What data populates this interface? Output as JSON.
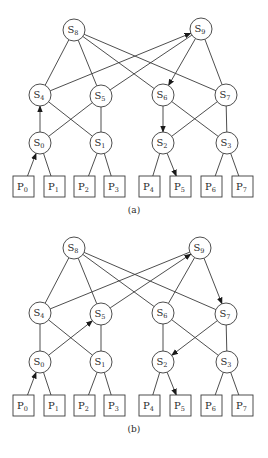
{
  "diagrams": [
    {
      "id": "a",
      "caption": "(a)",
      "caption_pos": [
        134,
        213
      ],
      "switches": [
        {
          "label": "S",
          "sub": "0",
          "x": 40,
          "y": 143
        },
        {
          "label": "S",
          "sub": "1",
          "x": 101,
          "y": 143
        },
        {
          "label": "S",
          "sub": "2",
          "x": 163,
          "y": 143
        },
        {
          "label": "S",
          "sub": "3",
          "x": 227,
          "y": 143
        },
        {
          "label": "S",
          "sub": "4",
          "x": 40,
          "y": 95
        },
        {
          "label": "S",
          "sub": "5",
          "x": 101,
          "y": 96
        },
        {
          "label": "S",
          "sub": "6",
          "x": 163,
          "y": 95
        },
        {
          "label": "S",
          "sub": "7",
          "x": 226,
          "y": 95
        },
        {
          "label": "S",
          "sub": "8",
          "x": 74,
          "y": 30
        },
        {
          "label": "S",
          "sub": "9",
          "x": 201,
          "y": 29
        }
      ],
      "processors": [
        {
          "label": "P",
          "sub": "0",
          "x": 13,
          "y": 176
        },
        {
          "label": "P",
          "sub": "1",
          "x": 44,
          "y": 176
        },
        {
          "label": "P",
          "sub": "2",
          "x": 74,
          "y": 176
        },
        {
          "label": "P",
          "sub": "3",
          "x": 104,
          "y": 176
        },
        {
          "label": "P",
          "sub": "4",
          "x": 139,
          "y": 176
        },
        {
          "label": "P",
          "sub": "5",
          "x": 170,
          "y": 176
        },
        {
          "label": "P",
          "sub": "6",
          "x": 201,
          "y": 176
        },
        {
          "label": "P",
          "sub": "7",
          "x": 232,
          "y": 176
        }
      ],
      "edges": [
        {
          "from": "P0",
          "to": "S0",
          "arrow": true
        },
        {
          "from": "P1",
          "to": "S0",
          "arrow": false
        },
        {
          "from": "P2",
          "to": "S1",
          "arrow": false
        },
        {
          "from": "P3",
          "to": "S1",
          "arrow": false
        },
        {
          "from": "P4",
          "to": "S2",
          "arrow": false
        },
        {
          "from": "S2",
          "to": "P5",
          "arrow": true
        },
        {
          "from": "P6",
          "to": "S3",
          "arrow": false
        },
        {
          "from": "P7",
          "to": "S3",
          "arrow": false
        },
        {
          "from": "S0",
          "to": "S4",
          "arrow": true
        },
        {
          "from": "S0",
          "to": "S5",
          "arrow": false
        },
        {
          "from": "S1",
          "to": "S4",
          "arrow": false
        },
        {
          "from": "S1",
          "to": "S5",
          "arrow": false
        },
        {
          "from": "S6",
          "to": "S2",
          "arrow": true
        },
        {
          "from": "S2",
          "to": "S7",
          "arrow": false
        },
        {
          "from": "S3",
          "to": "S6",
          "arrow": false
        },
        {
          "from": "S3",
          "to": "S7",
          "arrow": false
        },
        {
          "from": "S8",
          "to": "S4",
          "arrow": false
        },
        {
          "from": "S8",
          "to": "S5",
          "arrow": false
        },
        {
          "from": "S8",
          "to": "S6",
          "arrow": false
        },
        {
          "from": "S8",
          "to": "S7",
          "arrow": false
        },
        {
          "from": "S4",
          "to": "S9",
          "arrow": true
        },
        {
          "from": "S5",
          "to": "S9",
          "arrow": false
        },
        {
          "from": "S9",
          "to": "S6",
          "arrow": true
        },
        {
          "from": "S9",
          "to": "S7",
          "arrow": false
        }
      ]
    },
    {
      "id": "b",
      "caption": "(b)",
      "caption_pos": [
        134,
        432
      ],
      "switches": [
        {
          "label": "S",
          "sub": "0",
          "x": 40,
          "y": 362
        },
        {
          "label": "S",
          "sub": "1",
          "x": 101,
          "y": 362
        },
        {
          "label": "S",
          "sub": "2",
          "x": 163,
          "y": 362
        },
        {
          "label": "S",
          "sub": "3",
          "x": 227,
          "y": 362
        },
        {
          "label": "S",
          "sub": "4",
          "x": 40,
          "y": 313
        },
        {
          "label": "S",
          "sub": "5",
          "x": 101,
          "y": 314
        },
        {
          "label": "S",
          "sub": "6",
          "x": 163,
          "y": 313
        },
        {
          "label": "S",
          "sub": "7",
          "x": 226,
          "y": 314
        },
        {
          "label": "S",
          "sub": "8",
          "x": 74,
          "y": 248
        },
        {
          "label": "S",
          "sub": "9",
          "x": 200,
          "y": 248
        }
      ],
      "processors": [
        {
          "label": "P",
          "sub": "0",
          "x": 13,
          "y": 395
        },
        {
          "label": "P",
          "sub": "1",
          "x": 44,
          "y": 395
        },
        {
          "label": "P",
          "sub": "2",
          "x": 74,
          "y": 395
        },
        {
          "label": "P",
          "sub": "3",
          "x": 104,
          "y": 395
        },
        {
          "label": "P",
          "sub": "4",
          "x": 139,
          "y": 395
        },
        {
          "label": "P",
          "sub": "5",
          "x": 170,
          "y": 395
        },
        {
          "label": "P",
          "sub": "6",
          "x": 201,
          "y": 395
        },
        {
          "label": "P",
          "sub": "7",
          "x": 232,
          "y": 395
        }
      ],
      "edges": [
        {
          "from": "P0",
          "to": "S0",
          "arrow": true
        },
        {
          "from": "P1",
          "to": "S0",
          "arrow": false
        },
        {
          "from": "P2",
          "to": "S1",
          "arrow": false
        },
        {
          "from": "P3",
          "to": "S1",
          "arrow": false
        },
        {
          "from": "P4",
          "to": "S2",
          "arrow": false
        },
        {
          "from": "S2",
          "to": "P5",
          "arrow": true
        },
        {
          "from": "P6",
          "to": "S3",
          "arrow": false
        },
        {
          "from": "P7",
          "to": "S3",
          "arrow": false
        },
        {
          "from": "S0",
          "to": "S4",
          "arrow": false
        },
        {
          "from": "S0",
          "to": "S5",
          "arrow": true
        },
        {
          "from": "S1",
          "to": "S4",
          "arrow": false
        },
        {
          "from": "S1",
          "to": "S5",
          "arrow": false
        },
        {
          "from": "S6",
          "to": "S2",
          "arrow": false
        },
        {
          "from": "S7",
          "to": "S2",
          "arrow": true
        },
        {
          "from": "S3",
          "to": "S6",
          "arrow": false
        },
        {
          "from": "S3",
          "to": "S7",
          "arrow": false
        },
        {
          "from": "S8",
          "to": "S4",
          "arrow": false
        },
        {
          "from": "S8",
          "to": "S5",
          "arrow": false
        },
        {
          "from": "S8",
          "to": "S6",
          "arrow": false
        },
        {
          "from": "S8",
          "to": "S7",
          "arrow": false
        },
        {
          "from": "S4",
          "to": "S9",
          "arrow": false
        },
        {
          "from": "S5",
          "to": "S9",
          "arrow": true
        },
        {
          "from": "S9",
          "to": "S6",
          "arrow": false
        },
        {
          "from": "S9",
          "to": "S7",
          "arrow": true
        }
      ]
    }
  ],
  "style": {
    "circle_radius": 11,
    "box_width": 21,
    "box_height": 21,
    "stroke_color": "#3a3a3a"
  }
}
